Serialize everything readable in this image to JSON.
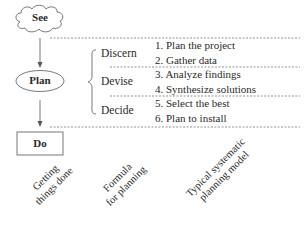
{
  "diagram": {
    "nodes": [
      {
        "id": "see",
        "label": "See",
        "shape": "cloud"
      },
      {
        "id": "plan",
        "label": "Plan",
        "shape": "ellipse"
      },
      {
        "id": "do",
        "label": "Do",
        "shape": "rectangle"
      }
    ],
    "edges": [
      {
        "from": "see",
        "to": "plan",
        "type": "arrow"
      },
      {
        "from": "plan",
        "to": "do",
        "type": "arrow"
      }
    ],
    "phases": [
      {
        "label": "Discern",
        "steps": [
          "1. Plan the project",
          "2. Gather data"
        ]
      },
      {
        "label": "Devise",
        "steps": [
          "3. Analyze findings",
          "4. Synthesize solutions"
        ]
      },
      {
        "label": "Decide",
        "steps": [
          "5. Select the best",
          "6. Plan to install"
        ]
      }
    ],
    "column_captions": [
      {
        "line1": "Getting",
        "line2": "things done"
      },
      {
        "line1": "Formula",
        "line2": "for planning"
      },
      {
        "line1": "Typical systematic",
        "line2": "planning model"
      }
    ],
    "colors": {
      "line": "#555555",
      "text": "#2a2a2a",
      "background": "#ffffff"
    }
  }
}
